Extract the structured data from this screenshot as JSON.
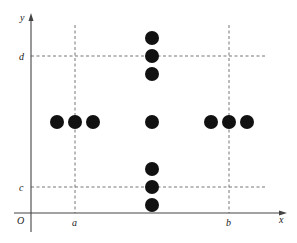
{
  "diagram": {
    "axes": {
      "x_label": "x",
      "y_label": "y",
      "origin_label": "O"
    },
    "reference_lines": {
      "vertical": [
        {
          "label": "a",
          "x": 75
        },
        {
          "label": "b",
          "x": 229
        }
      ],
      "horizontal": [
        {
          "label": "d",
          "y": 56
        },
        {
          "label": "c",
          "y": 187
        }
      ]
    },
    "points": {
      "color": "#111111",
      "radius": 7,
      "center_column_x": 152,
      "center_column_y": [
        38,
        56,
        74,
        122,
        169,
        187,
        205
      ],
      "left_row": {
        "y": 122,
        "x": [
          57,
          75,
          93
        ]
      },
      "right_row": {
        "y": 122,
        "x": [
          211,
          229,
          247
        ]
      }
    }
  }
}
